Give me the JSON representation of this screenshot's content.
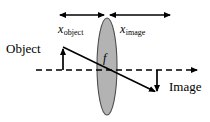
{
  "diagram": {
    "type": "thin-lens-ray-diagram",
    "colors": {
      "stroke": "#000000",
      "lens_fill": "#b3b3b3",
      "lens_stroke": "#4d4d4d",
      "background": "#ffffff"
    },
    "labels": {
      "x_object_var": "x",
      "x_object_sub": "object",
      "x_image_var": "x",
      "x_image_sub": "image",
      "object": "Object",
      "image": "Image",
      "focal_length": "f"
    },
    "geometry": {
      "lens": {
        "cx": 107,
        "cy": 66.5,
        "rx": 10,
        "ry": 48.5
      },
      "optical_axis": {
        "x1": 36,
        "y1": 70,
        "x2": 200,
        "y2": 70
      },
      "object_arrow": {
        "x": 63,
        "y_base": 70,
        "y_tip": 47
      },
      "image_arrow": {
        "x": 157,
        "y_base": 70,
        "y_tip": 93
      },
      "ray": {
        "x1": 63,
        "y1": 47,
        "x2": 157,
        "y2": 93
      },
      "dim_object": {
        "x1": 58,
        "x2": 105,
        "y": 15
      },
      "dim_image": {
        "x1": 109,
        "x2": 172,
        "y": 15
      }
    }
  }
}
